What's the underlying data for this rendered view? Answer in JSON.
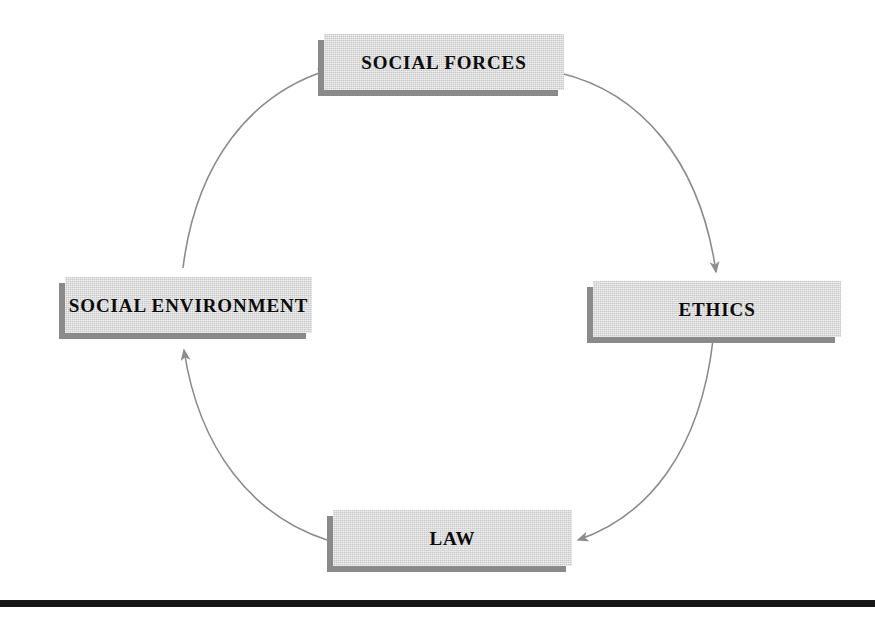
{
  "figure": {
    "background_color": "#ffffff",
    "box_fill_color": "#c9c9c9",
    "box_shadow_color": "#8a8a8a",
    "connector_color": "#8c8c8c",
    "label_color": "#0b0b0b",
    "rule_color": "#171717"
  },
  "nodes": [
    {
      "id": "social-forces",
      "label": "SOCIAL FORCES",
      "position": "top"
    },
    {
      "id": "ethics",
      "label": "ETHICS",
      "position": "right"
    },
    {
      "id": "law",
      "label": "LAW",
      "position": "bottom"
    },
    {
      "id": "social-environment",
      "label": "SOCIAL ENVIRONMENT",
      "position": "left"
    }
  ],
  "connectors": [
    {
      "id": "social-forces-to-ethics",
      "from": "social-forces",
      "to": "ethics",
      "direction": "clockwise"
    },
    {
      "id": "ethics-to-law",
      "from": "ethics",
      "to": "law",
      "direction": "clockwise"
    },
    {
      "id": "law-to-social-environment",
      "from": "law",
      "to": "social-environment",
      "direction": "clockwise"
    },
    {
      "id": "social-environment-to-social-forces",
      "from": "social-environment",
      "to": "social-forces",
      "direction": "clockwise"
    }
  ]
}
